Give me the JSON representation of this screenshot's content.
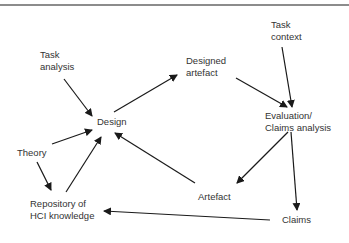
{
  "diagram": {
    "nodes": {
      "task_analysis": {
        "line1": "Task",
        "line2": "analysis"
      },
      "design": {
        "line1": "Design"
      },
      "designed_artefact": {
        "line1": "Designed",
        "line2": "artefact"
      },
      "task_context": {
        "line1": "Task",
        "line2": "context"
      },
      "evaluation": {
        "line1": "Evaluation/",
        "line2": "Claims analysis"
      },
      "theory": {
        "line1": "Theory"
      },
      "repository": {
        "line1": "Repository of",
        "line2": "HCI knowledge"
      },
      "artefact": {
        "line1": "Artefact"
      },
      "claims": {
        "line1": "Claims"
      }
    },
    "edges": [
      {
        "from": "Task analysis",
        "to": "Design"
      },
      {
        "from": "Theory",
        "to": "Design"
      },
      {
        "from": "Theory",
        "to": "Repository of HCI knowledge"
      },
      {
        "from": "Repository of HCI knowledge",
        "to": "Design"
      },
      {
        "from": "Design",
        "to": "Designed artefact"
      },
      {
        "from": "Designed artefact",
        "to": "Evaluation/Claims analysis"
      },
      {
        "from": "Task context",
        "to": "Evaluation/Claims analysis"
      },
      {
        "from": "Evaluation/Claims analysis",
        "to": "Artefact"
      },
      {
        "from": "Evaluation/Claims analysis",
        "to": "Claims"
      },
      {
        "from": "Artefact",
        "to": "Design"
      },
      {
        "from": "Claims",
        "to": "Repository of HCI knowledge"
      }
    ],
    "colors": {
      "line": "#1a1a1a",
      "text": "#333333",
      "rule": "#8c8c8c"
    }
  }
}
